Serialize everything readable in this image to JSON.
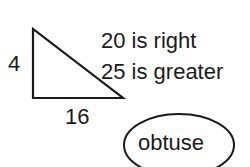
{
  "triangle": {
    "side_vertical_label": "4",
    "side_bottom_label": "16",
    "stroke_color": "#1a1a1a"
  },
  "notes": {
    "line1": "20 is right",
    "line2": "25 is greater"
  },
  "answer": {
    "label": "obtuse"
  }
}
